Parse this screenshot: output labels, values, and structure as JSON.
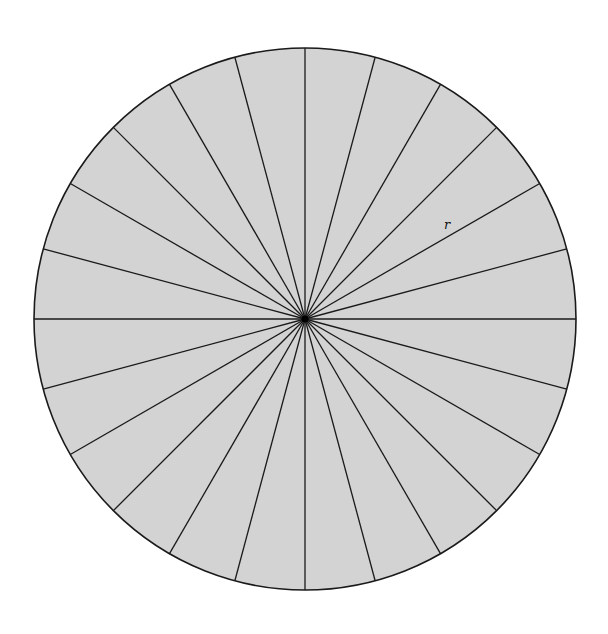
{
  "diagram": {
    "type": "circle divided into equal sectors",
    "sector_count": 24,
    "center": [
      305,
      319
    ],
    "radius": 271,
    "fill_color": "#d3d3d3",
    "stroke_color": "#1a1a1a",
    "label": {
      "text": "r",
      "x": 444,
      "y": 229
    }
  }
}
